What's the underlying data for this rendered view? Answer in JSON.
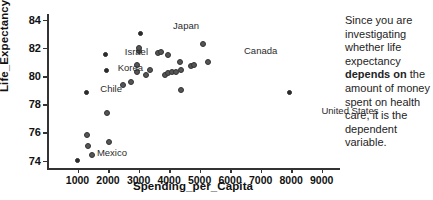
{
  "chart_data": {
    "type": "scatter",
    "title": "",
    "xlabel": "Spending_per_Capita",
    "ylabel": "Life_Expectancy",
    "xlim": [
      0,
      9600
    ],
    "ylim": [
      73.4,
      84.4
    ],
    "xticks": [
      1000,
      2000,
      3000,
      4000,
      5000,
      6000,
      7000,
      8000,
      9000
    ],
    "yticks": [
      74,
      76,
      78,
      80,
      82,
      84
    ],
    "grid": false,
    "legend": null,
    "points": [
      {
        "label": "Mexico",
        "x": 1000,
        "y": 74.0
      },
      {
        "label": "",
        "x": 1460,
        "y": 74.4
      },
      {
        "label": "",
        "x": 1330,
        "y": 75.0
      },
      {
        "label": "",
        "x": 2020,
        "y": 75.3
      },
      {
        "label": "",
        "x": 1320,
        "y": 75.8
      },
      {
        "label": "",
        "x": 1960,
        "y": 77.4
      },
      {
        "label": "Chile",
        "x": 1300,
        "y": 78.8
      },
      {
        "label": "",
        "x": 4400,
        "y": 79.0
      },
      {
        "label": "",
        "x": 2480,
        "y": 79.35
      },
      {
        "label": "",
        "x": 2760,
        "y": 79.6
      },
      {
        "label": "",
        "x": 3240,
        "y": 80.1
      },
      {
        "label": "",
        "x": 3850,
        "y": 80.1
      },
      {
        "label": "",
        "x": 3960,
        "y": 80.2
      },
      {
        "label": "",
        "x": 4090,
        "y": 80.25
      },
      {
        "label": "",
        "x": 4230,
        "y": 80.3
      },
      {
        "label": "",
        "x": 4380,
        "y": 80.4
      },
      {
        "label": "",
        "x": 2960,
        "y": 80.3
      },
      {
        "label": "",
        "x": 3380,
        "y": 80.4
      },
      {
        "label": "Korea",
        "x": 1960,
        "y": 80.4
      },
      {
        "label": "",
        "x": 2940,
        "y": 80.8
      },
      {
        "label": "",
        "x": 4730,
        "y": 80.7
      },
      {
        "label": "",
        "x": 4830,
        "y": 80.75
      },
      {
        "label": "",
        "x": 5260,
        "y": 81.0
      },
      {
        "label": "",
        "x": 4360,
        "y": 81.0
      },
      {
        "label": "Canada",
        "x": 3960,
        "y": 81.5
      },
      {
        "label": "",
        "x": 3640,
        "y": 81.6
      },
      {
        "label": "",
        "x": 3720,
        "y": 81.7
      },
      {
        "label": "Israel",
        "x": 1920,
        "y": 81.5
      },
      {
        "label": "",
        "x": 3010,
        "y": 81.75
      },
      {
        "label": "",
        "x": 3010,
        "y": 82.0
      },
      {
        "label": "",
        "x": 5120,
        "y": 82.3
      },
      {
        "label": "Japan",
        "x": 3060,
        "y": 83.0
      },
      {
        "label": "United States",
        "x": 7950,
        "y": 78.8
      }
    ],
    "annotations": [
      {
        "text": "Japan",
        "px": 152,
        "py": 21,
        "anchor": "right"
      },
      {
        "text": "Israel",
        "px": 101,
        "py": 47,
        "anchor": "right"
      },
      {
        "text": "Canada",
        "px": 197,
        "py": 46,
        "anchor": "left"
      },
      {
        "text": "Korea",
        "px": 96,
        "py": 63,
        "anchor": "right"
      },
      {
        "text": "Chile",
        "px": 75,
        "py": 84,
        "anchor": "right"
      },
      {
        "text": "Mexico",
        "px": 80,
        "py": 148,
        "anchor": "right"
      },
      {
        "text": "United States",
        "px": 303,
        "py": 106,
        "anchor": "center"
      }
    ]
  },
  "side_note": {
    "part1": "Since you are investigating whether life expectancy ",
    "emphasis": "depends on",
    "part2": " the amount of money spent on health care, it is the dependent variable."
  }
}
